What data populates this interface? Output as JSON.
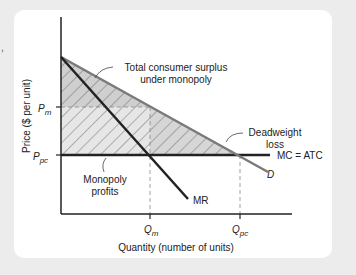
{
  "diagram": {
    "type": "monopoly-deadweight-loss",
    "y_axis_label": "Price ($ per unit)",
    "x_axis_label": "Quantity (number of units)",
    "price_ticks": [
      {
        "main": "P",
        "sub": "m"
      },
      {
        "main": "P",
        "sub": "pc"
      }
    ],
    "quantity_ticks": [
      {
        "main": "Q",
        "sub": "m"
      },
      {
        "main": "Q",
        "sub": "pc"
      }
    ],
    "curves": {
      "demand": "D",
      "marginal_revenue": "MR",
      "cost": "MC = ATC"
    },
    "annotations": {
      "consumer_surplus_line1": "Total consumer surplus",
      "consumer_surplus_line2": "under monopoly",
      "deadweight_line1": "Deadweight",
      "deadweight_line2": "loss",
      "profits_line1": "Monopoly",
      "profits_line2": "profits"
    },
    "colors": {
      "background": "#ececec",
      "panel": "#ffffff",
      "demand_line": "#7a7a7a",
      "axis": "#222222",
      "consumer_surplus_fill": "#cfcfcf",
      "profits_fill": "#e6e6e6",
      "hatch": "#555555"
    }
  },
  "stray_text": ","
}
